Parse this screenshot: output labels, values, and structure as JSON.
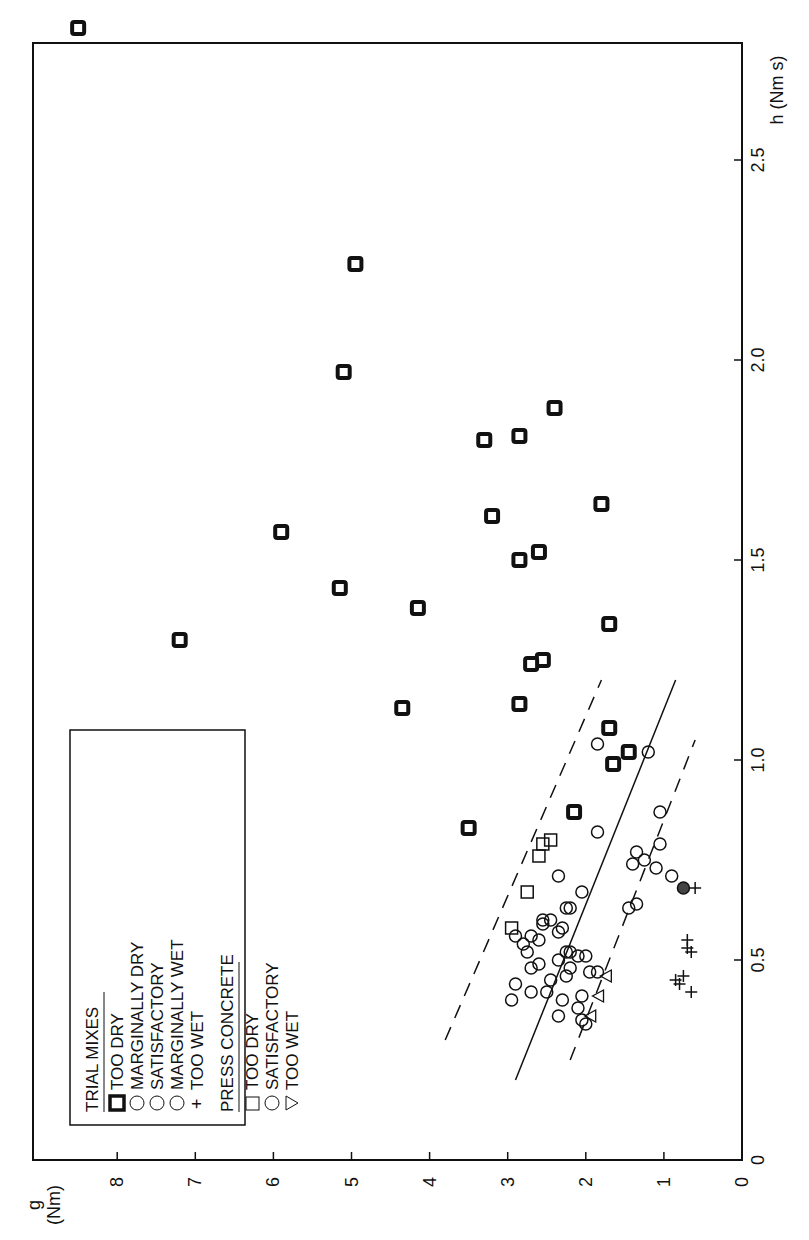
{
  "chart_data": {
    "type": "scatter",
    "orientation": "rotated 90 degrees counterclockwise (g axis along bottom, reading right-to-left; h axis along right edge, reading bottom-to-top)",
    "title": "",
    "xlabel": "h (Nm s)",
    "ylabel": "g (Nm)",
    "xlim": [
      0,
      2.8
    ],
    "ylim": [
      0,
      9
    ],
    "h_ticks": [
      "0",
      "0.5",
      "1.0",
      "1.5",
      "2.0",
      "2.5"
    ],
    "g_ticks": [
      "0",
      "1",
      "2",
      "3",
      "4",
      "5",
      "6",
      "7",
      "8"
    ],
    "grid": false,
    "legend": {
      "position": "upper-left (rotated frame)",
      "groups": [
        {
          "title": "TRIAL MIXES",
          "entries": [
            {
              "marker": "bold-square-circle",
              "label": "TOO DRY"
            },
            {
              "marker": "circle",
              "label": "MARGINALLY DRY"
            },
            {
              "marker": "circle",
              "label": "SATISFACTORY"
            },
            {
              "marker": "circle",
              "label": "MARGINALLY WET"
            },
            {
              "marker": "plus",
              "label": "TOO WET"
            }
          ]
        },
        {
          "title": "PRESS CONCRETE",
          "entries": [
            {
              "marker": "square",
              "label": "TOO DRY"
            },
            {
              "marker": "circle",
              "label": "SATISFACTORY"
            },
            {
              "marker": "triangle",
              "label": "TOO WET"
            }
          ]
        }
      ]
    },
    "series": [
      {
        "name": "Trial mixes - too dry",
        "marker": "bold-square-circle",
        "points": [
          [
            2.83,
            8.5
          ],
          [
            2.24,
            4.95
          ],
          [
            1.97,
            5.1
          ],
          [
            1.88,
            2.4
          ],
          [
            1.8,
            3.3
          ],
          [
            1.81,
            2.85
          ],
          [
            1.64,
            1.8
          ],
          [
            1.61,
            3.2
          ],
          [
            1.57,
            5.9
          ],
          [
            1.52,
            2.6
          ],
          [
            1.5,
            2.85
          ],
          [
            1.43,
            5.15
          ],
          [
            1.38,
            4.15
          ],
          [
            1.3,
            7.2
          ],
          [
            1.34,
            1.7
          ],
          [
            1.25,
            2.55
          ],
          [
            1.24,
            2.7
          ],
          [
            1.13,
            4.35
          ],
          [
            1.14,
            2.85
          ],
          [
            1.08,
            1.7
          ],
          [
            1.02,
            1.45
          ],
          [
            0.99,
            1.65
          ],
          [
            0.87,
            2.15
          ],
          [
            0.83,
            3.5
          ]
        ]
      },
      {
        "name": "Trial mixes - marginally dry / satisfactory / marginally wet",
        "marker": "circle",
        "points": [
          [
            1.04,
            1.85
          ],
          [
            1.02,
            1.2
          ],
          [
            0.87,
            1.05
          ],
          [
            0.82,
            1.85
          ],
          [
            0.79,
            1.05
          ],
          [
            0.77,
            1.35
          ],
          [
            0.75,
            1.25
          ],
          [
            0.74,
            1.4
          ],
          [
            0.73,
            1.1
          ],
          [
            0.71,
            0.9
          ],
          [
            0.67,
            2.05
          ],
          [
            0.64,
            1.35
          ],
          [
            0.63,
            1.45
          ],
          [
            0.71,
            2.35
          ],
          [
            0.63,
            2.2
          ],
          [
            0.63,
            2.25
          ],
          [
            0.6,
            2.55
          ],
          [
            0.6,
            2.45
          ],
          [
            0.59,
            2.55
          ],
          [
            0.57,
            2.35
          ],
          [
            0.58,
            2.3
          ],
          [
            0.56,
            2.9
          ],
          [
            0.56,
            2.7
          ],
          [
            0.55,
            2.6
          ],
          [
            0.54,
            2.8
          ],
          [
            0.52,
            2.75
          ],
          [
            0.52,
            2.25
          ],
          [
            0.52,
            2.2
          ],
          [
            0.51,
            2.1
          ],
          [
            0.51,
            2.0
          ],
          [
            0.5,
            2.35
          ],
          [
            0.49,
            2.6
          ],
          [
            0.48,
            2.7
          ],
          [
            0.48,
            2.2
          ],
          [
            0.47,
            1.85
          ],
          [
            0.47,
            1.95
          ],
          [
            0.46,
            2.25
          ],
          [
            0.45,
            2.45
          ],
          [
            0.44,
            2.9
          ],
          [
            0.42,
            2.7
          ],
          [
            0.42,
            2.5
          ],
          [
            0.41,
            2.05
          ],
          [
            0.4,
            2.95
          ],
          [
            0.4,
            2.3
          ],
          [
            0.38,
            2.1
          ],
          [
            0.36,
            2.35
          ],
          [
            0.35,
            2.05
          ],
          [
            0.34,
            2.0
          ]
        ]
      },
      {
        "name": "Trial mixes - too wet",
        "marker": "plus",
        "points": [
          [
            0.68,
            0.6
          ],
          [
            0.55,
            0.7
          ],
          [
            0.53,
            0.7
          ],
          [
            0.52,
            0.65
          ],
          [
            0.46,
            0.75
          ],
          [
            0.45,
            0.85
          ],
          [
            0.44,
            0.8
          ],
          [
            0.42,
            0.65
          ]
        ]
      },
      {
        "name": "Press concrete - too dry",
        "marker": "square",
        "points": [
          [
            0.8,
            2.45
          ],
          [
            0.79,
            2.55
          ],
          [
            0.76,
            2.6
          ],
          [
            0.67,
            2.75
          ],
          [
            0.58,
            2.95
          ]
        ]
      },
      {
        "name": "Press concrete - too wet",
        "marker": "triangle",
        "points": [
          [
            0.46,
            1.75
          ],
          [
            0.41,
            1.85
          ],
          [
            0.36,
            1.95
          ]
        ]
      },
      {
        "name": "Press concrete - satisfactory (hatched)",
        "marker": "hatched-circle",
        "points": [
          [
            0.68,
            0.75
          ]
        ]
      }
    ],
    "lines": [
      {
        "style": "solid",
        "from": [
          0.2,
          2.9
        ],
        "to": [
          1.2,
          0.85
        ]
      },
      {
        "style": "dashed",
        "from": [
          0.3,
          3.8
        ],
        "to": [
          1.2,
          1.8
        ]
      },
      {
        "style": "dashed",
        "from": [
          0.25,
          2.2
        ],
        "to": [
          1.05,
          0.6
        ]
      }
    ]
  },
  "axis": {
    "g_label_line1": "g",
    "g_label_line2": "(Nm)",
    "h_label": "h (Nm s)",
    "g_ticks": [
      "8",
      "7",
      "6",
      "5",
      "4",
      "3",
      "2",
      "1",
      "0"
    ],
    "h_ticks": [
      "0",
      "0.5",
      "1.0",
      "1.5",
      "2.0",
      "2.5"
    ],
    "origin_label": "0"
  },
  "legend": {
    "group1_title": "TRIAL MIXES",
    "group1": [
      "TOO DRY",
      "MARGINALLY DRY",
      "SATISFACTORY",
      "MARGINALLY WET",
      "TOO WET"
    ],
    "group2_title": "PRESS CONCRETE",
    "group2": [
      "TOO DRY",
      "SATISFACTORY",
      "TOO WET"
    ]
  }
}
